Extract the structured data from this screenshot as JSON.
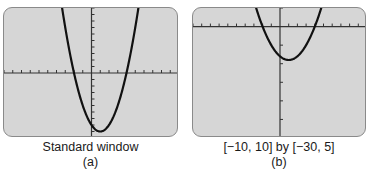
{
  "chart_data": [
    {
      "type": "line",
      "panel_label": "(a)",
      "caption": "Standard window",
      "function": "y = x^2 - 2x - 8",
      "xlim": [
        -10,
        10
      ],
      "ylim": [
        -10,
        10
      ],
      "xscale": 1,
      "yscale": 1,
      "grid": false,
      "series": [
        {
          "name": "parabola",
          "x": [
            -10,
            -9,
            -8,
            -7,
            -6,
            -5,
            -4,
            -3,
            -2,
            -1,
            0,
            1,
            2,
            3,
            4,
            5,
            6,
            7,
            8,
            9,
            10
          ],
          "values": [
            112,
            91,
            72,
            55,
            40,
            27,
            16,
            7,
            0,
            -5,
            -8,
            -9,
            -8,
            -5,
            0,
            7,
            16,
            27,
            40,
            55,
            72
          ]
        }
      ],
      "roots": [
        -2,
        4
      ],
      "vertex": [
        1,
        -9
      ]
    },
    {
      "type": "line",
      "panel_label": "(b)",
      "caption": "[−10, 10] by [−30, 5]",
      "function": "y = x^2 - 2x - 8",
      "xlim": [
        -10,
        10
      ],
      "ylim": [
        -30,
        5
      ],
      "xscale": 1,
      "yscale": 5,
      "grid": false,
      "series": [
        {
          "name": "parabola",
          "x": [
            -10,
            -9,
            -8,
            -7,
            -6,
            -5,
            -4,
            -3,
            -2,
            -1,
            0,
            1,
            2,
            3,
            4,
            5,
            6,
            7,
            8,
            9,
            10
          ],
          "values": [
            112,
            91,
            72,
            55,
            40,
            27,
            16,
            7,
            0,
            -5,
            -8,
            -9,
            -8,
            -5,
            0,
            7,
            16,
            27,
            40,
            55,
            72
          ]
        }
      ],
      "roots": [
        -2,
        4
      ],
      "vertex": [
        1,
        -9
      ]
    }
  ],
  "panels": {
    "a": {
      "caption": "Standard window",
      "label": "(a)"
    },
    "b": {
      "caption": "[−10, 10] by [−30, 5]",
      "label": "(b)"
    }
  },
  "colors": {
    "screen": "#d6d6d6",
    "frame": "#8a8a8a",
    "curve": "#111111",
    "axis": "#333333"
  }
}
